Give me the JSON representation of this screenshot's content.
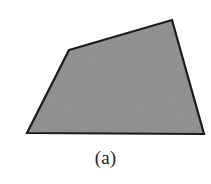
{
  "figure": {
    "caption": "(a)",
    "background_color": "#ffffff",
    "shape": {
      "name": "quadrilateral",
      "fill_color": "#888888",
      "stroke_color": "#1a1a1a",
      "stroke_width": 2.2,
      "vertices": [
        {
          "x": 69,
          "y": 50
        },
        {
          "x": 172,
          "y": 20
        },
        {
          "x": 204,
          "y": 134
        },
        {
          "x": 27,
          "y": 133
        }
      ],
      "points_attr": "69,50 172,20 204,134 27,133"
    },
    "texture": {
      "name": "fine-noise-grain",
      "base_color": "#888888",
      "speckle_light": "#939393",
      "speckle_dark": "#7e7e7e"
    }
  }
}
